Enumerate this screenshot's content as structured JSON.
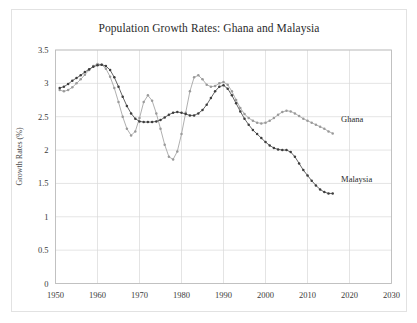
{
  "chart_data": {
    "type": "line",
    "title": "Population Growth Rates: Ghana and Malaysia",
    "xlabel": "",
    "ylabel": "Growth Rates (%)",
    "xlim": [
      1950,
      2030
    ],
    "ylim": [
      0,
      3.5
    ],
    "xticks": [
      1950,
      1960,
      1970,
      1980,
      1990,
      2000,
      2010,
      2020,
      2030
    ],
    "yticks": [
      0,
      0.5,
      1,
      1.5,
      2,
      2.5,
      3,
      3.5
    ],
    "xtick_labels": [
      "1950",
      "1960",
      "1970",
      "1980",
      "1990",
      "2000",
      "2010",
      "2020",
      "2030"
    ],
    "ytick_labels": [
      "0",
      "0.5",
      "1",
      "1.5",
      "2",
      "2.5",
      "3",
      "3.5"
    ],
    "grid": true,
    "legend_position": "inline-annotation",
    "markers": "filled-circle",
    "series": [
      {
        "name": "Ghana",
        "color": "#9a9a9a",
        "label_x": 2018,
        "label_y": 2.42,
        "x": [
          1951,
          1952,
          1953,
          1954,
          1955,
          1956,
          1957,
          1958,
          1959,
          1960,
          1961,
          1962,
          1963,
          1964,
          1965,
          1966,
          1967,
          1968,
          1969,
          1970,
          1971,
          1972,
          1973,
          1974,
          1975,
          1976,
          1977,
          1978,
          1979,
          1980,
          1981,
          1982,
          1983,
          1984,
          1985,
          1986,
          1987,
          1988,
          1989,
          1990,
          1991,
          1992,
          1993,
          1994,
          1995,
          1996,
          1997,
          1998,
          1999,
          2000,
          2001,
          2002,
          2003,
          2004,
          2005,
          2006,
          2007,
          2008,
          2009,
          2010,
          2011,
          2012,
          2013,
          2014,
          2015,
          2016
        ],
        "values": [
          2.9,
          2.88,
          2.9,
          2.94,
          3.0,
          3.06,
          3.13,
          3.2,
          3.26,
          3.29,
          3.28,
          3.22,
          3.1,
          2.93,
          2.72,
          2.5,
          2.32,
          2.22,
          2.28,
          2.48,
          2.72,
          2.82,
          2.74,
          2.55,
          2.32,
          2.08,
          1.9,
          1.86,
          1.98,
          2.24,
          2.56,
          2.88,
          3.09,
          3.12,
          3.06,
          2.98,
          2.95,
          2.96,
          3.0,
          3.02,
          2.98,
          2.88,
          2.75,
          2.63,
          2.54,
          2.48,
          2.44,
          2.41,
          2.4,
          2.41,
          2.44,
          2.48,
          2.53,
          2.57,
          2.59,
          2.58,
          2.55,
          2.51,
          2.47,
          2.44,
          2.41,
          2.38,
          2.35,
          2.32,
          2.28,
          2.25
        ]
      },
      {
        "name": "Malaysia",
        "color": "#3d3d3d",
        "label_x": 2018,
        "label_y": 1.52,
        "x": [
          1951,
          1952,
          1953,
          1954,
          1955,
          1956,
          1957,
          1958,
          1959,
          1960,
          1961,
          1962,
          1963,
          1964,
          1965,
          1966,
          1967,
          1968,
          1969,
          1970,
          1971,
          1972,
          1973,
          1974,
          1975,
          1976,
          1977,
          1978,
          1979,
          1980,
          1981,
          1982,
          1983,
          1984,
          1985,
          1986,
          1987,
          1988,
          1989,
          1990,
          1991,
          1992,
          1993,
          1994,
          1995,
          1996,
          1997,
          1998,
          1999,
          2000,
          2001,
          2002,
          2003,
          2004,
          2005,
          2006,
          2007,
          2008,
          2009,
          2010,
          2011,
          2012,
          2013,
          2014,
          2015,
          2016
        ],
        "values": [
          2.93,
          2.95,
          2.99,
          3.04,
          3.08,
          3.12,
          3.17,
          3.21,
          3.25,
          3.27,
          3.28,
          3.26,
          3.2,
          3.09,
          2.95,
          2.8,
          2.66,
          2.55,
          2.47,
          2.43,
          2.42,
          2.42,
          2.42,
          2.43,
          2.45,
          2.49,
          2.53,
          2.56,
          2.57,
          2.56,
          2.54,
          2.52,
          2.52,
          2.55,
          2.6,
          2.68,
          2.78,
          2.88,
          2.95,
          2.97,
          2.92,
          2.82,
          2.7,
          2.58,
          2.47,
          2.38,
          2.3,
          2.24,
          2.18,
          2.12,
          2.07,
          2.03,
          2.01,
          2.0,
          2.0,
          1.97,
          1.9,
          1.8,
          1.7,
          1.62,
          1.54,
          1.47,
          1.41,
          1.37,
          1.35,
          1.35
        ]
      }
    ]
  }
}
